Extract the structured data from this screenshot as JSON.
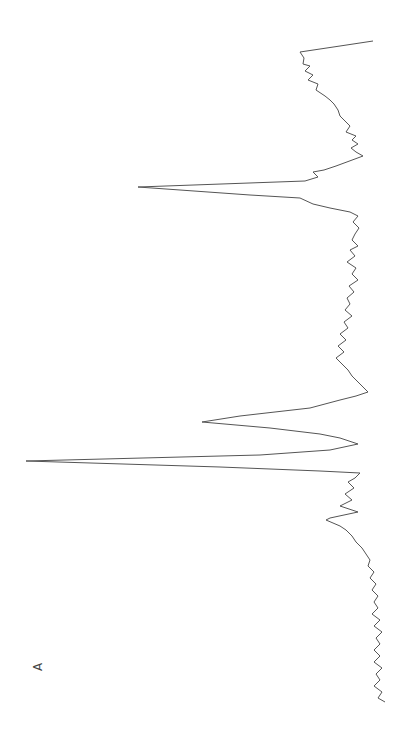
{
  "chart_data": {
    "type": "line",
    "orientation": "rotated-90",
    "title": "",
    "panel_label": "A",
    "xlabel": "",
    "ylabel": "",
    "grid": false,
    "legend": null,
    "line_color": "#555555",
    "series": [
      {
        "name": "spectrum",
        "points": [
          [
            373,
            41
          ],
          [
            340,
            46
          ],
          [
            300,
            52
          ],
          [
            304,
            58
          ],
          [
            303,
            64
          ],
          [
            310,
            66
          ],
          [
            305,
            71
          ],
          [
            313,
            75
          ],
          [
            308,
            80
          ],
          [
            318,
            84
          ],
          [
            316,
            90
          ],
          [
            325,
            96
          ],
          [
            330,
            100
          ],
          [
            334,
            104
          ],
          [
            338,
            110
          ],
          [
            340,
            116
          ],
          [
            344,
            120
          ],
          [
            350,
            126
          ],
          [
            346,
            132
          ],
          [
            356,
            136
          ],
          [
            352,
            140
          ],
          [
            358,
            144
          ],
          [
            351,
            148
          ],
          [
            356,
            152
          ],
          [
            363,
            156
          ],
          [
            336,
            166
          ],
          [
            324,
            170
          ],
          [
            313,
            172
          ],
          [
            318,
            177
          ],
          [
            305,
            181
          ],
          [
            138,
            187
          ],
          [
            250,
            195
          ],
          [
            300,
            198
          ],
          [
            313,
            204
          ],
          [
            330,
            208
          ],
          [
            350,
            212
          ],
          [
            358,
            216
          ],
          [
            353,
            222
          ],
          [
            359,
            228
          ],
          [
            355,
            234
          ],
          [
            352,
            240
          ],
          [
            358,
            246
          ],
          [
            350,
            250
          ],
          [
            355,
            256
          ],
          [
            347,
            262
          ],
          [
            356,
            268
          ],
          [
            352,
            274
          ],
          [
            358,
            280
          ],
          [
            349,
            286
          ],
          [
            354,
            292
          ],
          [
            347,
            298
          ],
          [
            350,
            304
          ],
          [
            345,
            310
          ],
          [
            352,
            316
          ],
          [
            344,
            322
          ],
          [
            348,
            328
          ],
          [
            340,
            334
          ],
          [
            346,
            340
          ],
          [
            338,
            346
          ],
          [
            344,
            352
          ],
          [
            336,
            358
          ],
          [
            342,
            364
          ],
          [
            348,
            370
          ],
          [
            352,
            376
          ],
          [
            358,
            382
          ],
          [
            364,
            388
          ],
          [
            368,
            392
          ],
          [
            356,
            396
          ],
          [
            340,
            400
          ],
          [
            310,
            408
          ],
          [
            240,
            416
          ],
          [
            202,
            422
          ],
          [
            270,
            428
          ],
          [
            320,
            434
          ],
          [
            340,
            438
          ],
          [
            358,
            444
          ],
          [
            330,
            450
          ],
          [
            260,
            455
          ],
          [
            26,
            461
          ],
          [
            220,
            467
          ],
          [
            320,
            471
          ],
          [
            360,
            473
          ],
          [
            355,
            478
          ],
          [
            348,
            482
          ],
          [
            354,
            488
          ],
          [
            345,
            494
          ],
          [
            352,
            500
          ],
          [
            340,
            506
          ],
          [
            358,
            512
          ],
          [
            330,
            518
          ],
          [
            326,
            520
          ],
          [
            340,
            526
          ],
          [
            346,
            530
          ],
          [
            352,
            536
          ],
          [
            356,
            542
          ],
          [
            362,
            548
          ],
          [
            366,
            554
          ],
          [
            370,
            560
          ],
          [
            368,
            566
          ],
          [
            374,
            572
          ],
          [
            370,
            578
          ],
          [
            376,
            584
          ],
          [
            372,
            590
          ],
          [
            378,
            596
          ],
          [
            374,
            602
          ],
          [
            378,
            608
          ],
          [
            372,
            614
          ],
          [
            380,
            620
          ],
          [
            374,
            626
          ],
          [
            382,
            632
          ],
          [
            376,
            638
          ],
          [
            380,
            644
          ],
          [
            374,
            650
          ],
          [
            380,
            656
          ],
          [
            374,
            662
          ],
          [
            382,
            668
          ],
          [
            376,
            674
          ],
          [
            380,
            680
          ],
          [
            374,
            686
          ],
          [
            382,
            692
          ],
          [
            378,
            698
          ],
          [
            385,
            702
          ]
        ]
      }
    ],
    "peaks": [
      {
        "label": "major peak",
        "x_px": 26,
        "y_px": 461
      },
      {
        "label": "second peak",
        "x_px": 202,
        "y_px": 422
      },
      {
        "label": "third peak",
        "x_px": 138,
        "y_px": 187
      }
    ]
  }
}
